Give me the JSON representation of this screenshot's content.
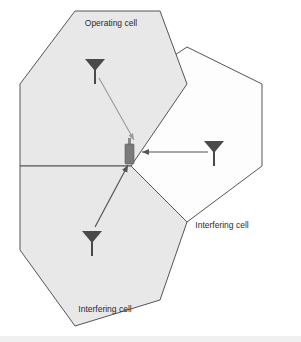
{
  "figure": {
    "width": 301,
    "height": 342,
    "background_color": "#ffffff"
  },
  "colors": {
    "cell_fill_shaded": "#e8e8e8",
    "cell_fill_plain": "#fdfdfd",
    "cell_stroke": "#555555",
    "antenna": "#4a4a4a",
    "handset": "#7a7a7a",
    "arrow_desired": "#9a9a9a",
    "arrow_interfering": "#555555",
    "label_text": "#2b2b2b"
  },
  "cells": [
    {
      "id": "operating",
      "label": "Operating cell",
      "fill": "shaded",
      "label_x": 111,
      "label_y": 24
    },
    {
      "id": "interfering-right",
      "label": "Interfering cell",
      "fill": "plain",
      "label_x": 222,
      "label_y": 226
    },
    {
      "id": "interfering-bottom",
      "label": "Interfering cell",
      "fill": "shaded",
      "label_x": 105,
      "label_y": 310
    }
  ],
  "antennas": [
    {
      "id": "antenna-operating",
      "cell": "operating",
      "x": 95,
      "y": 65
    },
    {
      "id": "antenna-interfering-right",
      "cell": "interfering-right",
      "x": 214,
      "y": 147
    },
    {
      "id": "antenna-interfering-bottom",
      "cell": "interfering-bottom",
      "x": 92,
      "y": 237
    }
  ],
  "handset": {
    "id": "mobile-handset",
    "x": 131,
    "y": 152,
    "label": "Mobile station"
  },
  "signals": [
    {
      "id": "desired-signal",
      "from": "antenna-operating",
      "to": "mobile-handset",
      "kind": "desired",
      "color": "#9a9a9a"
    },
    {
      "id": "interference-from-right",
      "from": "antenna-interfering-right",
      "to": "mobile-handset",
      "kind": "interference",
      "color": "#555555"
    },
    {
      "id": "interference-from-bottom",
      "from": "antenna-interfering-bottom",
      "to": "mobile-handset",
      "kind": "interference",
      "color": "#555555"
    }
  ]
}
